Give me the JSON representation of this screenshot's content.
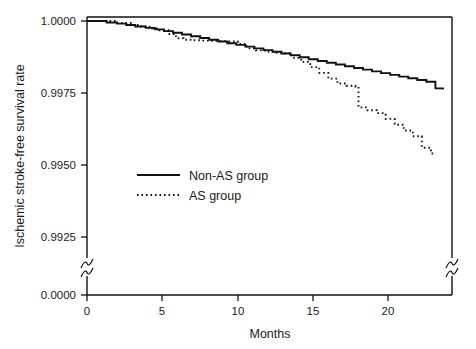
{
  "chart_data": {
    "type": "line",
    "title": "",
    "xlabel": "Months",
    "ylabel": "Ischemic stroke-free survival rate",
    "xlim": [
      0,
      24.2
    ],
    "ylim": [
      0.99125,
      1.0
    ],
    "grid": false,
    "axis_break": {
      "present": true,
      "axis": "y",
      "note": "y-axis broken between 0.9925 and 0.0000",
      "break_marks": [
        "left-spine",
        "right-spine"
      ]
    },
    "xticks": [
      0,
      5,
      10,
      15,
      20
    ],
    "xticklabels": [
      "0",
      "5",
      "10",
      "15",
      "20"
    ],
    "yticks": [
      1.0,
      0.9975,
      0.995,
      0.9925,
      0.0
    ],
    "yticklabels": [
      "1.0000",
      "0.9975",
      "0.9950",
      "0.9925",
      "0.0000"
    ],
    "legend": {
      "position": "center-left",
      "entries": [
        {
          "name": "Non-AS group",
          "style": "solid"
        },
        {
          "name": "AS group",
          "style": "dotted"
        }
      ]
    },
    "series": [
      {
        "name": "Non-AS group",
        "style": "solid",
        "color": "#111111",
        "x": [
          0,
          0.8,
          1.3,
          2.0,
          2.6,
          3.2,
          3.9,
          4.5,
          5.1,
          5.7,
          6.3,
          6.9,
          7.5,
          8.1,
          8.7,
          9.3,
          9.9,
          10.5,
          11.1,
          11.7,
          12.3,
          12.9,
          13.5,
          14.1,
          14.7,
          15.3,
          15.9,
          16.5,
          17.1,
          17.7,
          18.3,
          18.9,
          19.5,
          20.1,
          20.7,
          21.3,
          21.9,
          22.5,
          23.1,
          23.6
        ],
        "y": [
          1.0,
          1.0,
          0.99995,
          0.99991,
          0.99986,
          0.99981,
          0.99976,
          0.99971,
          0.99965,
          0.99959,
          0.99953,
          0.99947,
          0.99941,
          0.99935,
          0.99929,
          0.99923,
          0.99917,
          0.99911,
          0.99905,
          0.99899,
          0.99893,
          0.99887,
          0.99881,
          0.99874,
          0.99867,
          0.99861,
          0.99855,
          0.99849,
          0.99843,
          0.99837,
          0.99831,
          0.99825,
          0.99819,
          0.99813,
          0.99807,
          0.99801,
          0.99795,
          0.99789,
          0.99766,
          0.99762
        ]
      },
      {
        "name": "AS group",
        "style": "dotted",
        "color": "#111111",
        "x": [
          0,
          1.0,
          2.0,
          3.0,
          3.6,
          4.2,
          4.8,
          5.4,
          5.9,
          6.4,
          7.0,
          7.6,
          8.2,
          8.8,
          9.4,
          10.0,
          10.6,
          11.2,
          11.8,
          12.4,
          13.0,
          13.6,
          14.2,
          14.8,
          15.4,
          16.0,
          16.6,
          17.2,
          17.8,
          18.0,
          18.6,
          19.2,
          19.8,
          20.4,
          21.0,
          21.6,
          22.2,
          22.8,
          23.0
        ],
        "y": [
          1.0,
          1.0,
          0.99993,
          0.99986,
          0.9998,
          0.99974,
          0.99968,
          0.99955,
          0.9994,
          0.99935,
          0.99933,
          0.99932,
          0.99931,
          0.9993,
          0.99929,
          0.9992,
          0.99905,
          0.99898,
          0.99893,
          0.9989,
          0.99888,
          0.99872,
          0.99858,
          0.9984,
          0.9982,
          0.998,
          0.99783,
          0.99775,
          0.99772,
          0.997,
          0.9969,
          0.9968,
          0.9966,
          0.9964,
          0.9962,
          0.996,
          0.9956,
          0.9954,
          0.99535
        ]
      }
    ]
  },
  "axes": {
    "xlabel": "Months",
    "ylabel": "Ischemic stroke-free survival rate"
  },
  "legend": {
    "entry_0": "Non-AS group",
    "entry_1": "AS group"
  },
  "xticklabels": {
    "t0": "0",
    "t1": "5",
    "t2": "10",
    "t3": "15",
    "t4": "20"
  },
  "yticklabels": {
    "t0": "1.0000",
    "t1": "0.9975",
    "t2": "0.9950",
    "t3": "0.9925",
    "t4": "0.0000"
  }
}
